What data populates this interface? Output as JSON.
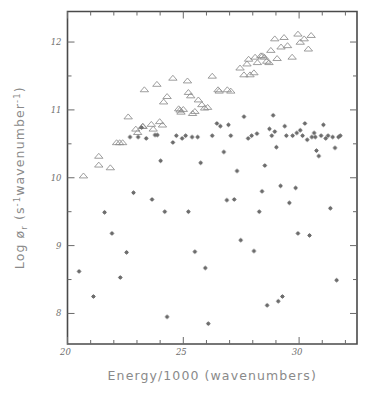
{
  "figure": {
    "background": "#ffffff",
    "frame_color": "#4a4a4a",
    "marker_colors": {
      "triangle": "#8d8d8d",
      "star": "#6d6d6d"
    }
  },
  "chart_data": {
    "type": "scatter",
    "title": "",
    "xlabel": "Energy/1000  (wavenumbers)",
    "ylabel": "Log ør (s⁻¹wavenumber⁻¹)",
    "ylabel_parts": {
      "prefix": "Log ø",
      "subscript": "r",
      "open_paren": " (s",
      "sup1": "-1",
      "middle": "wavenumber",
      "sup2": "-1",
      "close_paren": ")"
    },
    "xlim": [
      20,
      32.5
    ],
    "ylim": [
      7.55,
      12.45
    ],
    "xticks_major": [
      20,
      25,
      30
    ],
    "xticks_major_labels": [
      "20",
      "25",
      "30"
    ],
    "xticks_minor": [
      21,
      22,
      23,
      24,
      26,
      27,
      28,
      29,
      31,
      32
    ],
    "yticks_major": [
      8,
      9,
      10,
      11,
      12
    ],
    "yticks_major_labels": [
      "8",
      "9",
      "10",
      "11",
      "12"
    ],
    "yticks_minor": [
      8.5,
      9.5,
      10.5,
      11.5
    ],
    "grid": false,
    "legend": "none",
    "series": [
      {
        "name": "triangles",
        "marker": "open-triangle",
        "points": [
          [
            20.69,
            10.03
          ],
          [
            21.35,
            10.32
          ],
          [
            21.35,
            10.19
          ],
          [
            21.85,
            10.15
          ],
          [
            22.12,
            10.52
          ],
          [
            22.25,
            10.52
          ],
          [
            22.38,
            10.52
          ],
          [
            22.62,
            10.9
          ],
          [
            22.95,
            10.72
          ],
          [
            23.03,
            10.67
          ],
          [
            23.24,
            10.76
          ],
          [
            23.26,
            10.76
          ],
          [
            23.32,
            11.3
          ],
          [
            23.62,
            10.79
          ],
          [
            23.7,
            10.72
          ],
          [
            23.86,
            11.38
          ],
          [
            23.98,
            10.83
          ],
          [
            24.1,
            10.78
          ],
          [
            24.15,
            11.12
          ],
          [
            24.3,
            11.2
          ],
          [
            24.55,
            11.47
          ],
          [
            24.8,
            11.02
          ],
          [
            24.86,
            11.0
          ],
          [
            24.9,
            10.97
          ],
          [
            25.0,
            11.01
          ],
          [
            25.18,
            11.43
          ],
          [
            25.22,
            11.26
          ],
          [
            25.32,
            11.21
          ],
          [
            25.4,
            10.95
          ],
          [
            25.5,
            10.98
          ],
          [
            25.65,
            11.15
          ],
          [
            25.8,
            11.08
          ],
          [
            25.92,
            11.03
          ],
          [
            26.05,
            11.04
          ],
          [
            26.25,
            11.5
          ],
          [
            26.5,
            11.3
          ],
          [
            26.55,
            11.28
          ],
          [
            26.9,
            11.3
          ],
          [
            27.05,
            11.28
          ],
          [
            27.45,
            11.62
          ],
          [
            27.62,
            11.52
          ],
          [
            27.75,
            11.68
          ],
          [
            27.82,
            11.75
          ],
          [
            27.88,
            11.52
          ],
          [
            28.05,
            11.55
          ],
          [
            28.1,
            11.78
          ],
          [
            28.2,
            11.7
          ],
          [
            28.35,
            11.8
          ],
          [
            28.42,
            11.8
          ],
          [
            28.5,
            11.78
          ],
          [
            28.6,
            11.72
          ],
          [
            28.7,
            11.7
          ],
          [
            28.78,
            11.88
          ],
          [
            28.95,
            12.05
          ],
          [
            29.05,
            11.76
          ],
          [
            29.22,
            11.93
          ],
          [
            29.35,
            12.07
          ],
          [
            29.5,
            11.95
          ],
          [
            29.7,
            11.78
          ],
          [
            29.95,
            12.12
          ],
          [
            30.05,
            12.0
          ],
          [
            30.22,
            12.05
          ],
          [
            30.4,
            11.9
          ],
          [
            30.52,
            12.1
          ]
        ]
      },
      {
        "name": "stars",
        "marker": "star",
        "points": [
          [
            20.5,
            8.62
          ],
          [
            21.12,
            8.25
          ],
          [
            21.6,
            9.49
          ],
          [
            21.92,
            9.18
          ],
          [
            22.28,
            8.53
          ],
          [
            22.55,
            8.9
          ],
          [
            22.85,
            9.78
          ],
          [
            23.2,
            10.74
          ],
          [
            23.4,
            10.58
          ],
          [
            23.65,
            9.68
          ],
          [
            23.78,
            10.63
          ],
          [
            23.88,
            10.63
          ],
          [
            24.02,
            10.25
          ],
          [
            24.2,
            9.5
          ],
          [
            24.3,
            7.95
          ],
          [
            24.55,
            10.52
          ],
          [
            24.7,
            10.62
          ],
          [
            24.95,
            10.58
          ],
          [
            25.1,
            10.62
          ],
          [
            25.22,
            9.5
          ],
          [
            25.38,
            10.6
          ],
          [
            25.5,
            8.91
          ],
          [
            25.62,
            10.6
          ],
          [
            25.75,
            10.22
          ],
          [
            25.95,
            8.67
          ],
          [
            26.08,
            7.85
          ],
          [
            26.25,
            10.62
          ],
          [
            26.45,
            10.8
          ],
          [
            26.6,
            10.76
          ],
          [
            26.75,
            10.38
          ],
          [
            26.88,
            9.67
          ],
          [
            27.05,
            10.62
          ],
          [
            27.2,
            9.68
          ],
          [
            27.32,
            10.1
          ],
          [
            27.48,
            9.08
          ],
          [
            27.62,
            10.9
          ],
          [
            27.8,
            10.58
          ],
          [
            27.95,
            10.62
          ],
          [
            28.05,
            8.92
          ],
          [
            28.18,
            10.65
          ],
          [
            28.28,
            9.5
          ],
          [
            28.4,
            9.8
          ],
          [
            28.52,
            10.18
          ],
          [
            28.62,
            8.12
          ],
          [
            28.72,
            10.72
          ],
          [
            28.82,
            10.62
          ],
          [
            28.95,
            10.68
          ],
          [
            29.02,
            10.45
          ],
          [
            29.1,
            8.18
          ],
          [
            29.2,
            9.88
          ],
          [
            29.28,
            8.25
          ],
          [
            29.38,
            10.76
          ],
          [
            29.45,
            10.62
          ],
          [
            29.58,
            9.63
          ],
          [
            29.72,
            10.62
          ],
          [
            29.85,
            9.85
          ],
          [
            29.95,
            9.18
          ],
          [
            30.05,
            10.7
          ],
          [
            30.15,
            10.62
          ],
          [
            30.25,
            10.8
          ],
          [
            30.35,
            10.56
          ],
          [
            30.45,
            9.15
          ],
          [
            30.55,
            10.6
          ],
          [
            30.65,
            10.66
          ],
          [
            30.75,
            10.4
          ],
          [
            30.85,
            10.32
          ],
          [
            30.95,
            10.62
          ],
          [
            31.05,
            10.78
          ],
          [
            31.15,
            10.58
          ],
          [
            31.25,
            10.62
          ],
          [
            31.35,
            9.55
          ],
          [
            31.45,
            10.6
          ],
          [
            31.55,
            10.44
          ],
          [
            31.62,
            8.49
          ],
          [
            31.7,
            10.6
          ],
          [
            31.78,
            10.62
          ],
          [
            22.7,
            10.6
          ],
          [
            23.05,
            10.6
          ],
          [
            26.95,
            10.78
          ],
          [
            29.9,
            10.66
          ],
          [
            30.7,
            10.6
          ],
          [
            28.88,
            10.92
          ]
        ]
      }
    ]
  }
}
